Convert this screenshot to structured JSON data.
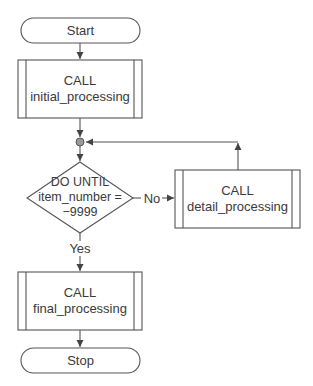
{
  "diagram": {
    "type": "flowchart",
    "colors": {
      "stroke": "#555555",
      "text": "#3a3a3a",
      "junction_fill": "#9a9a9a",
      "background": "#ffffff"
    },
    "nodes": {
      "start": {
        "shape": "terminator",
        "label": "Start"
      },
      "initial": {
        "shape": "predefined-process",
        "line1": "CALL",
        "line2": "initial_processing"
      },
      "junction": {
        "shape": "connector-circle"
      },
      "decision": {
        "shape": "diamond",
        "line1": "DO UNTIL",
        "line2": "item_number =",
        "line3": "−9999"
      },
      "detail": {
        "shape": "predefined-process",
        "line1": "CALL",
        "line2": "detail_processing"
      },
      "final": {
        "shape": "predefined-process",
        "line1": "CALL",
        "line2": "final_processing"
      },
      "stop": {
        "shape": "terminator",
        "label": "Stop"
      }
    },
    "edges": {
      "no_label": "No",
      "yes_label": "Yes"
    }
  }
}
